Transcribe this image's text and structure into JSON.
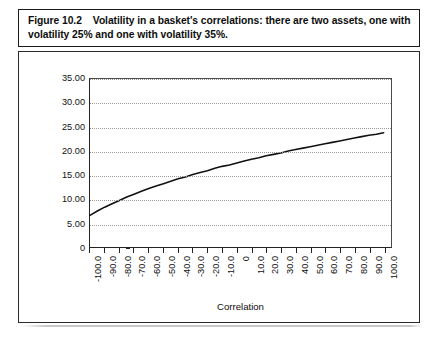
{
  "caption": {
    "figure_number": "Figure 10.2",
    "text": "Volatility in a basket's correlations: there are two assets, one with volatility 25% and one with volatility 35%."
  },
  "chart_data": {
    "type": "line",
    "title": "",
    "xlabel": "Correlation",
    "ylabel": "Volatility of the basket (%)",
    "xlim": [
      -100,
      105
    ],
    "ylim": [
      0,
      35
    ],
    "grid": true,
    "legend": "none",
    "line_color": "#111111",
    "x_tick_labels": [
      "-100.0",
      "-90.0",
      "-80.0",
      "-70.0",
      "-60.0",
      "-50.0",
      "-40.0",
      "-30.0",
      "-20.0",
      "-10.0",
      "0",
      "10.0",
      "20.0",
      "30.0",
      "40.0",
      "50.0",
      "60.0",
      "70.0",
      "80.0",
      "90.0",
      "100.0"
    ],
    "x_tick_values": [
      -100,
      -90,
      -80,
      -70,
      -60,
      -50,
      -40,
      -30,
      -20,
      -10,
      0,
      10,
      20,
      30,
      40,
      50,
      60,
      70,
      80,
      90,
      100
    ],
    "y_tick_labels": [
      "0",
      "5.00",
      "10.00",
      "15.00",
      "20.00",
      "25.00",
      "30.00",
      "35.00"
    ],
    "y_tick_values": [
      0,
      5,
      10,
      15,
      20,
      25,
      30,
      35
    ],
    "series": [
      {
        "name": "Volatility of the basket",
        "x": [
          -100,
          -95,
          -90,
          -85,
          -80,
          -75,
          -70,
          -65,
          -60,
          -55,
          -50,
          -45,
          -40,
          -35,
          -30,
          -25,
          -20,
          -15,
          -10,
          -5,
          0,
          5,
          10,
          15,
          20,
          25,
          30,
          35,
          40,
          45,
          50,
          55,
          60,
          65,
          70,
          75,
          80,
          85,
          90,
          95,
          100
        ],
        "values": [
          6.6,
          7.5,
          8.3,
          9.0,
          9.7,
          10.4,
          11.0,
          11.6,
          12.2,
          12.7,
          13.2,
          13.7,
          14.2,
          14.6,
          15.1,
          15.5,
          15.9,
          16.4,
          16.8,
          17.1,
          17.5,
          17.9,
          18.3,
          18.6,
          19.0,
          19.3,
          19.6,
          20.0,
          20.3,
          20.6,
          20.9,
          21.2,
          21.5,
          21.8,
          22.1,
          22.4,
          22.7,
          23.0,
          23.3,
          23.5,
          23.8
        ]
      }
    ]
  }
}
